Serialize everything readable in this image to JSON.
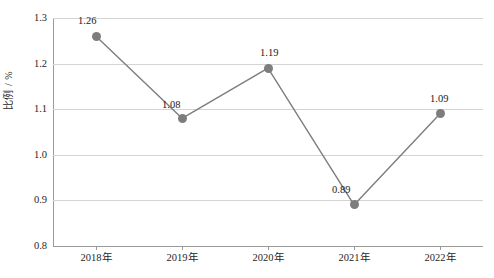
{
  "chart_data": {
    "type": "line",
    "title": "",
    "subtitle": "",
    "xlabel": "",
    "ylabel": "比例 / %",
    "categories": [
      "2018年",
      "2019年",
      "2020年",
      "2021年",
      "2022年"
    ],
    "values": [
      1.26,
      1.08,
      1.19,
      0.89,
      1.09
    ],
    "point_labels": [
      "1.26",
      "1.08",
      "1.19",
      "0.89",
      "1.09"
    ],
    "ylim": [
      0.8,
      1.3
    ],
    "y_ticks": [
      0.8,
      0.9,
      1.0,
      1.1,
      1.2,
      1.3
    ],
    "y_tick_labels": [
      "0.8",
      "0.9",
      "1.0",
      "1.1",
      "1.2",
      "1.3"
    ],
    "grid": true,
    "grid_axis": "y",
    "legend": false,
    "legend_position": "none",
    "series": [
      {
        "name": "比例",
        "values": [
          1.26,
          1.08,
          1.19,
          0.89,
          1.09
        ],
        "color": "#7d7d7d",
        "marker": "circle",
        "line_style": "solid"
      }
    ],
    "colors": {
      "line": "#7d7d7d",
      "marker": "#7d7d7d",
      "gridline": "#d4d4d4",
      "axis": "#9a9a9a",
      "text": "#1a1a1a",
      "background": "#ffffff"
    },
    "label_offsets": [
      {
        "dx": -18,
        "dy": -20
      },
      {
        "dx": -20,
        "dy": -18
      },
      {
        "dx": -8,
        "dy": -20
      },
      {
        "dx": -22,
        "dy": -20
      },
      {
        "dx": -10,
        "dy": -20
      }
    ]
  }
}
